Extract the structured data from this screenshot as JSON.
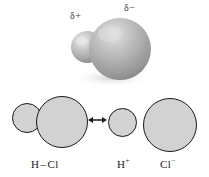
{
  "figure": {
    "background_color": "#ffffff"
  },
  "model_3d": {
    "description": "space-filling model of hydrogen chloride",
    "atoms": [
      {
        "name": "hydrogen",
        "symbol": "H",
        "charge_label": "δ+",
        "size": "small",
        "color": "#b9b9b9"
      },
      {
        "name": "chlorine",
        "symbol": "Cl",
        "charge_label": "δ−",
        "size": "large",
        "color": "#b0b0b0"
      }
    ],
    "labels": {
      "delta_plus": "δ+",
      "delta_minus": "δ−"
    }
  },
  "structures_2d": {
    "left_structure": {
      "name": "covalent-hcl",
      "label_h": "H",
      "label_bond": "–",
      "label_cl": "Cl",
      "circles": [
        {
          "name": "hydrogen-circle",
          "size": "small"
        },
        {
          "name": "chlorine-circle",
          "size": "large"
        }
      ]
    },
    "resonance_arrow": {
      "name": "double-headed-arrow",
      "glyph": "↔"
    },
    "right_structure": {
      "name": "ionic-hcl",
      "cation": {
        "element": "H",
        "charge": "+"
      },
      "anion": {
        "element": "Cl",
        "charge": "−"
      },
      "circles": [
        {
          "name": "hydrogen-ion-circle",
          "size": "small"
        },
        {
          "name": "chloride-ion-circle",
          "size": "large"
        }
      ]
    }
  },
  "colors": {
    "outline": "#1a1a1a",
    "circle_fill": "#d2d2d2",
    "sphere_light": "#e0e0e0",
    "sphere_dark": "#8f8f8f",
    "text": "#1a1a1a",
    "delta_text": "#3a3a3a"
  }
}
